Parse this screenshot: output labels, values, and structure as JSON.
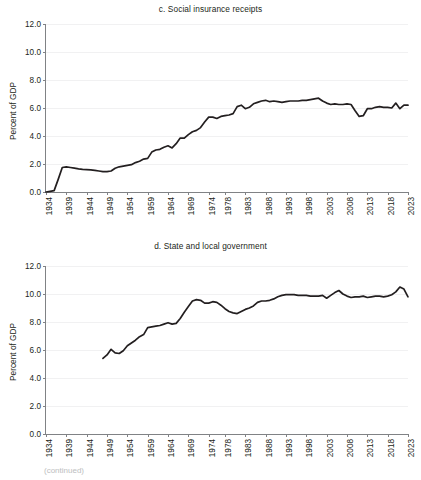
{
  "figure": {
    "y_axis_title": "Percent of GDP",
    "footer_fragment": "(continued)"
  },
  "chart_data": [
    {
      "id": "c",
      "type": "line",
      "title": "c. Social insurance receipts",
      "xlabel": "",
      "ylabel": "Percent of GDP",
      "ylim": [
        0,
        12
      ],
      "yticks": [
        "0.0",
        "2.0",
        "4.0",
        "6.0",
        "8.0",
        "10.0",
        "12.0"
      ],
      "ytick_values": [
        0,
        2,
        4,
        6,
        8,
        10,
        12
      ],
      "xlim": [
        1934,
        2023
      ],
      "xticks": [
        "1934",
        "1939",
        "1944",
        "1949",
        "1954",
        "1959",
        "1964",
        "1969",
        "1974",
        "1978",
        "1983",
        "1988",
        "1993",
        "1998",
        "2003",
        "2008",
        "2013",
        "2018",
        "2023"
      ],
      "xtick_values": [
        1934,
        1939,
        1944,
        1949,
        1954,
        1959,
        1964,
        1969,
        1974,
        1978,
        1983,
        1988,
        1993,
        1998,
        2003,
        2008,
        2013,
        2018,
        2023
      ],
      "grid": true,
      "legend": "none",
      "series": [
        {
          "name": "Social insurance receipts",
          "color": "#231f20",
          "x": [
            1934,
            1935,
            1936,
            1937,
            1938,
            1939,
            1940,
            1941,
            1942,
            1943,
            1944,
            1945,
            1946,
            1947,
            1948,
            1949,
            1950,
            1951,
            1952,
            1953,
            1954,
            1955,
            1956,
            1957,
            1958,
            1959,
            1960,
            1961,
            1962,
            1963,
            1964,
            1965,
            1966,
            1967,
            1968,
            1969,
            1970,
            1971,
            1972,
            1973,
            1974,
            1975,
            1976,
            1977,
            1978,
            1979,
            1980,
            1981,
            1982,
            1983,
            1984,
            1985,
            1986,
            1987,
            1988,
            1989,
            1990,
            1991,
            1992,
            1993,
            1994,
            1995,
            1996,
            1997,
            1998,
            1999,
            2000,
            2001,
            2002,
            2003,
            2004,
            2005,
            2006,
            2007,
            2008,
            2009,
            2010,
            2011,
            2012,
            2013,
            2014,
            2015,
            2016,
            2017,
            2018,
            2019,
            2020,
            2021,
            2022,
            2023
          ],
          "y": [
            0.0,
            0.05,
            0.1,
            0.9,
            1.75,
            1.8,
            1.75,
            1.7,
            1.65,
            1.62,
            1.6,
            1.58,
            1.55,
            1.5,
            1.45,
            1.45,
            1.5,
            1.7,
            1.8,
            1.85,
            1.9,
            1.95,
            2.1,
            2.2,
            2.35,
            2.4,
            2.85,
            3.0,
            3.05,
            3.2,
            3.3,
            3.15,
            3.45,
            3.85,
            3.85,
            4.1,
            4.3,
            4.4,
            4.6,
            5.0,
            5.35,
            5.35,
            5.25,
            5.4,
            5.45,
            5.5,
            5.6,
            6.1,
            6.2,
            5.95,
            6.05,
            6.3,
            6.4,
            6.5,
            6.55,
            6.45,
            6.5,
            6.45,
            6.4,
            6.45,
            6.5,
            6.5,
            6.5,
            6.55,
            6.55,
            6.6,
            6.65,
            6.7,
            6.5,
            6.35,
            6.25,
            6.3,
            6.25,
            6.25,
            6.3,
            6.25,
            5.8,
            5.4,
            5.45,
            5.95,
            5.95,
            6.05,
            6.1,
            6.05,
            6.05,
            6.0,
            6.35,
            5.95,
            6.2,
            6.2
          ]
        }
      ]
    },
    {
      "id": "d",
      "type": "line",
      "title": "d. State and local government",
      "xlabel": "",
      "ylabel": "Percent of GDP",
      "ylim": [
        0,
        12
      ],
      "yticks": [
        "0.0",
        "2.0",
        "4.0",
        "6.0",
        "8.0",
        "10.0",
        "12.0"
      ],
      "ytick_values": [
        0,
        2,
        4,
        6,
        8,
        10,
        12
      ],
      "xlim": [
        1934,
        2023
      ],
      "xticks": [
        "1934",
        "1939",
        "1944",
        "1949",
        "1954",
        "1959",
        "1964",
        "1969",
        "1974",
        "1978",
        "1983",
        "1988",
        "1993",
        "1998",
        "2003",
        "2008",
        "2013",
        "2018",
        "2023"
      ],
      "xtick_values": [
        1934,
        1939,
        1944,
        1949,
        1954,
        1959,
        1964,
        1969,
        1974,
        1978,
        1983,
        1988,
        1993,
        1998,
        2003,
        2008,
        2013,
        2018,
        2023
      ],
      "grid": true,
      "legend": "none",
      "series": [
        {
          "name": "State and local government",
          "color": "#231f20",
          "x": [
            1948,
            1949,
            1950,
            1951,
            1952,
            1953,
            1954,
            1955,
            1956,
            1957,
            1958,
            1959,
            1960,
            1961,
            1962,
            1963,
            1964,
            1965,
            1966,
            1967,
            1968,
            1969,
            1970,
            1971,
            1972,
            1973,
            1974,
            1975,
            1976,
            1977,
            1978,
            1979,
            1980,
            1981,
            1982,
            1983,
            1984,
            1985,
            1986,
            1987,
            1988,
            1989,
            1990,
            1991,
            1992,
            1993,
            1994,
            1995,
            1996,
            1997,
            1998,
            1999,
            2000,
            2001,
            2002,
            2003,
            2004,
            2005,
            2006,
            2007,
            2008,
            2009,
            2010,
            2011,
            2012,
            2013,
            2014,
            2015,
            2016,
            2017,
            2018,
            2019,
            2020,
            2021,
            2022,
            2023
          ],
          "y": [
            5.4,
            5.65,
            6.05,
            5.8,
            5.75,
            5.95,
            6.3,
            6.5,
            6.7,
            6.95,
            7.1,
            7.6,
            7.65,
            7.7,
            7.75,
            7.85,
            7.95,
            7.85,
            7.9,
            8.25,
            8.7,
            9.1,
            9.5,
            9.6,
            9.55,
            9.35,
            9.35,
            9.45,
            9.4,
            9.2,
            8.95,
            8.75,
            8.65,
            8.6,
            8.75,
            8.9,
            9.0,
            9.15,
            9.4,
            9.5,
            9.5,
            9.55,
            9.65,
            9.8,
            9.9,
            9.95,
            9.95,
            9.95,
            9.9,
            9.9,
            9.9,
            9.85,
            9.85,
            9.85,
            9.9,
            9.7,
            9.9,
            10.1,
            10.25,
            10.0,
            9.85,
            9.75,
            9.8,
            9.8,
            9.85,
            9.75,
            9.8,
            9.85,
            9.85,
            9.8,
            9.85,
            9.95,
            10.15,
            10.5,
            10.35,
            9.8
          ]
        }
      ]
    }
  ]
}
